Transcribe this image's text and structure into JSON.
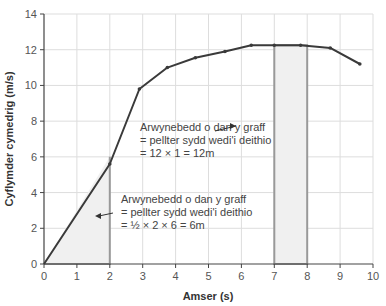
{
  "chart_data": {
    "type": "line",
    "title": "",
    "xlabel": "Amser (s)",
    "ylabel": "Cyflymder cymedrig (m/s)",
    "xlim": [
      0,
      10
    ],
    "ylim": [
      0,
      14
    ],
    "xticks": [
      0,
      1,
      2,
      3,
      4,
      5,
      6,
      7,
      8,
      9,
      10
    ],
    "yticks": [
      0,
      2,
      4,
      6,
      8,
      10,
      12,
      14
    ],
    "grid": true,
    "series": [
      {
        "name": "cyflymder",
        "x": [
          0,
          2,
          2.9,
          3.75,
          4.6,
          5.5,
          6.3,
          7,
          7.8,
          8.7,
          9.6
        ],
        "y": [
          0,
          5.6,
          9.8,
          11.0,
          11.55,
          11.9,
          12.25,
          12.25,
          12.25,
          12.1,
          11.2
        ],
        "color": "#3a3a3a"
      }
    ],
    "shaded_regions": [
      {
        "shape": "triangle",
        "x": [
          0,
          2
        ],
        "y_top": 6
      },
      {
        "shape": "rectangle",
        "x": [
          7,
          8
        ],
        "y_top": 12.25
      }
    ],
    "annotations": [
      {
        "lines": [
          "Arwynebedd o dan y graff",
          "= pellter sydd wedi'i deithio",
          "= 12 × 1 = 12m"
        ],
        "arrow_to": [
          7.3,
          7
        ]
      },
      {
        "lines": [
          "Arwynebedd o dan y graff",
          "= pellter sydd wedi'i deithio",
          "= ½ × 2 × 6 = 6m"
        ],
        "arrow_to": [
          1.5,
          2.7
        ]
      }
    ]
  },
  "colors": {
    "line": "#3a3a3a",
    "grid": "#dddddd",
    "shade": "#f0f0f0",
    "shade_border": "#999999",
    "axis": "#444444",
    "text": "#444444"
  }
}
